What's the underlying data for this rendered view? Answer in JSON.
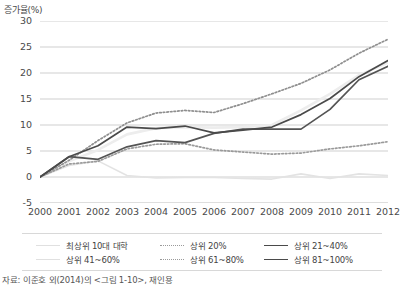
{
  "chart_data": {
    "type": "line",
    "title": "",
    "ylabel": "증가율(%)",
    "xlabel": "",
    "ylim": [
      -5,
      30
    ],
    "yticks": [
      -5,
      0,
      5,
      10,
      15,
      20,
      25,
      30
    ],
    "grid": true,
    "legend_position": "bottom",
    "x": [
      2000,
      2001,
      2002,
      2003,
      2004,
      2005,
      2006,
      2007,
      2008,
      2009,
      2010,
      2011,
      2012
    ],
    "categories": [
      "2000",
      "2001",
      "2002",
      "2003",
      "2004",
      "2005",
      "2006",
      "2007",
      "2008",
      "2009",
      "2010",
      "2011",
      "2012"
    ],
    "series": [
      {
        "name": "최상위 10대 대학",
        "style": "solid",
        "color": "#e3e3e3",
        "width": 1.6,
        "values": [
          0,
          2.2,
          3.1,
          0.3,
          -0.2,
          -0.1,
          -0.1,
          -0.3,
          -0.4,
          0.6,
          -0.3,
          0.6,
          0.3
        ]
      },
      {
        "name": "상위 20%",
        "style": "dotted",
        "color": "#8f8f8f",
        "width": 1.7,
        "values": [
          0,
          3.2,
          7.0,
          10.4,
          12.3,
          12.8,
          12.4,
          14.1,
          16.0,
          18.0,
          20.6,
          23.8,
          26.5
        ]
      },
      {
        "name": "상위 21~40%",
        "style": "solid",
        "color": "#4a4a4a",
        "width": 1.7,
        "values": [
          0,
          3.9,
          6.0,
          9.6,
          9.3,
          9.8,
          8.5,
          9.0,
          9.6,
          12.0,
          15.1,
          19.3,
          22.4
        ]
      },
      {
        "name": "상위 41~60%",
        "style": "solid",
        "color": "#ededed",
        "width": 2.6,
        "values": [
          0,
          3.0,
          5.2,
          8.2,
          9.4,
          9.6,
          9.5,
          9.6,
          10.0,
          12.8,
          16.0,
          19.6,
          22.0
        ]
      },
      {
        "name": "상위 61~80%",
        "style": "dotted",
        "color": "#9a9a9a",
        "width": 1.7,
        "values": [
          0,
          2.5,
          3.0,
          5.4,
          6.3,
          6.4,
          5.2,
          4.8,
          4.4,
          4.6,
          5.4,
          6.0,
          6.8
        ]
      },
      {
        "name": "상위 81~100%",
        "style": "solid",
        "color": "#545454",
        "width": 1.7,
        "values": [
          0,
          3.9,
          3.4,
          5.8,
          7.0,
          6.6,
          8.4,
          9.2,
          9.2,
          9.2,
          13.0,
          18.7,
          21.3
        ]
      }
    ],
    "source_note": "자료: 이준호 외(2014)의 <그림 1-10>, 재인용"
  },
  "legend": {
    "rows": [
      [
        {
          "label": "최상위 10대 대학",
          "style": "solid",
          "color": "#e0e0e0"
        },
        {
          "label": "상위 20%",
          "style": "dotted",
          "color": "#9a9a9a"
        },
        {
          "label": "상위 21~40%",
          "style": "solid",
          "color": "#4a4a4a"
        }
      ],
      [
        {
          "label": "상위 41~60%",
          "style": "solid",
          "color": "#e0e0e0"
        },
        {
          "label": "상위 61~80%",
          "style": "dotted",
          "color": "#9a9a9a"
        },
        {
          "label": "상위 81~100%",
          "style": "solid",
          "color": "#4a4a4a"
        }
      ]
    ]
  }
}
